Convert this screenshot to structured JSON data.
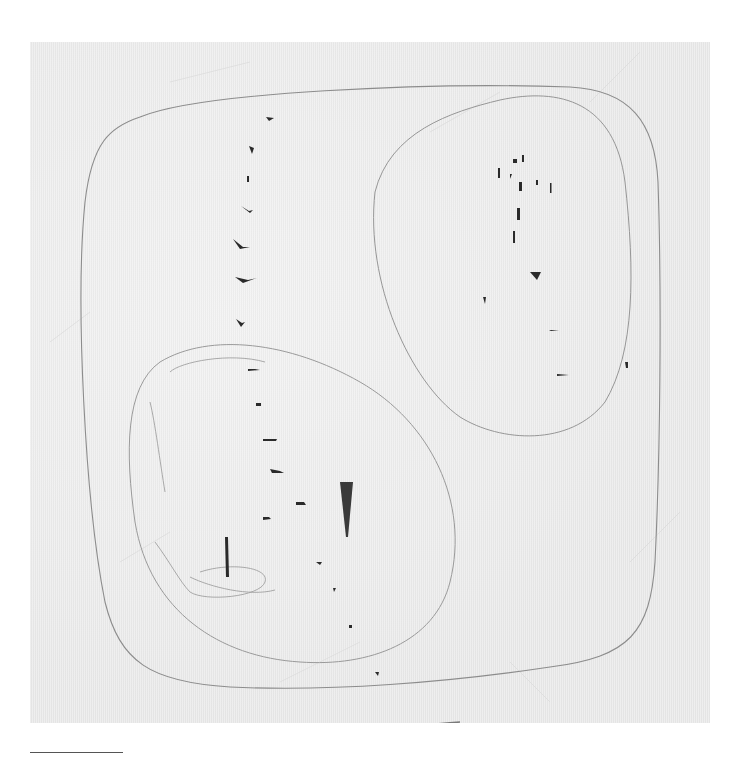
{
  "artwork": {
    "description": "Photograph of a white textured canvas with incised lines and punctures",
    "colors": {
      "canvas": "#ececec",
      "incision": "#8a8a8a",
      "puncture": "#2a2a2a",
      "background": "#ffffff"
    }
  }
}
